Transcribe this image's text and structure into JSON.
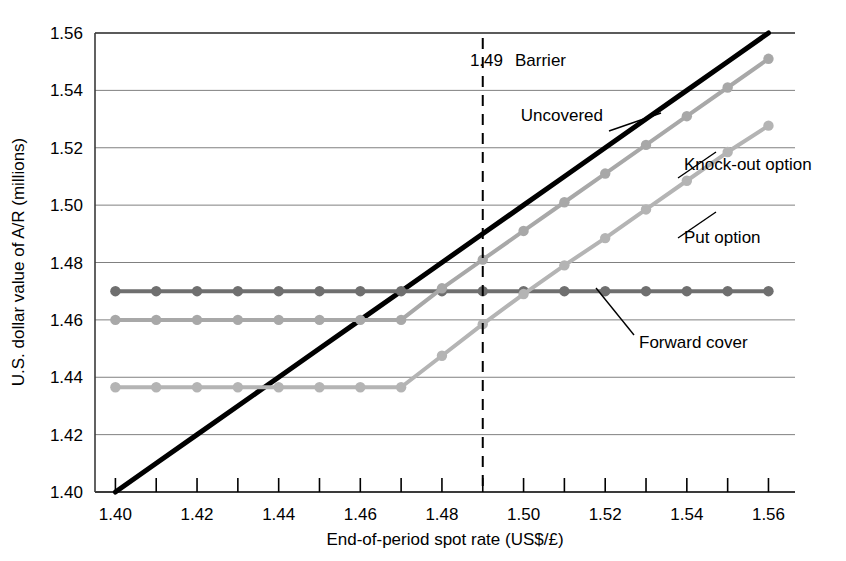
{
  "chart_data": {
    "type": "line",
    "title": "",
    "xlabel": "End-of-period spot rate (US$/£)",
    "ylabel": "U.S. dollar value of A/R (millions)",
    "xlim": [
      1.395,
      1.5665
    ],
    "ylim": [
      1.4,
      1.56
    ],
    "grid": true,
    "legend_position": "inline-annotations",
    "x_ticks": [
      "1.40",
      "1.42",
      "1.44",
      "1.46",
      "1.48",
      "1.50",
      "1.52",
      "1.54",
      "1.56"
    ],
    "x_tick_values": [
      1.4,
      1.42,
      1.44,
      1.46,
      1.48,
      1.5,
      1.52,
      1.54,
      1.56
    ],
    "x_minor_tick_values": [
      1.41,
      1.43,
      1.45,
      1.47,
      1.49,
      1.51,
      1.53,
      1.55
    ],
    "y_ticks": [
      "1.40",
      "1.42",
      "1.44",
      "1.46",
      "1.48",
      "1.50",
      "1.52",
      "1.54",
      "1.56"
    ],
    "y_tick_values": [
      1.4,
      1.42,
      1.44,
      1.46,
      1.48,
      1.5,
      1.52,
      1.54,
      1.56
    ],
    "x": [
      1.4,
      1.41,
      1.42,
      1.43,
      1.44,
      1.45,
      1.46,
      1.47,
      1.48,
      1.49,
      1.5,
      1.51,
      1.52,
      1.53,
      1.54,
      1.55,
      1.56
    ],
    "series": [
      {
        "name": "Uncovered",
        "color": "#000000",
        "width": 5,
        "markers": false,
        "values": [
          1.4,
          1.41,
          1.42,
          1.43,
          1.44,
          1.45,
          1.46,
          1.47,
          1.48,
          1.49,
          1.5,
          1.51,
          1.52,
          1.53,
          1.54,
          1.55,
          1.56
        ]
      },
      {
        "name": "Forward cover",
        "color": "#6f6f6f",
        "width": 4,
        "markers": true,
        "values": [
          1.47,
          1.47,
          1.47,
          1.47,
          1.47,
          1.47,
          1.47,
          1.47,
          1.47,
          1.47,
          1.47,
          1.47,
          1.47,
          1.47,
          1.47,
          1.47,
          1.47
        ]
      },
      {
        "name": "Knock-out option",
        "color": "#a8a8a8",
        "width": 4,
        "markers": true,
        "values": [
          1.46,
          1.46,
          1.46,
          1.46,
          1.46,
          1.46,
          1.46,
          1.46,
          1.471,
          1.481,
          1.491,
          1.501,
          1.511,
          1.521,
          1.531,
          1.541,
          1.551
        ]
      },
      {
        "name": "Put option",
        "color": "#b4b4b4",
        "width": 4,
        "markers": true,
        "values": [
          1.4365,
          1.4365,
          1.4365,
          1.4365,
          1.4365,
          1.4365,
          1.4365,
          1.4365,
          1.4475,
          1.4585,
          1.469,
          1.479,
          1.4885,
          1.4985,
          1.5085,
          1.5185,
          1.5277
        ]
      }
    ],
    "annotations": [
      {
        "name": "barrier",
        "label": "Barrier",
        "value_label": "1.49",
        "x": 1.49,
        "style": "vertical-dashed",
        "color": "#000000"
      },
      {
        "name": "uncovered-label",
        "label": "Uncovered"
      },
      {
        "name": "knock-out-label",
        "label": "Knock-out option"
      },
      {
        "name": "put-option-label",
        "label": "Put option"
      },
      {
        "name": "forward-cover-label",
        "label": "Forward cover"
      }
    ]
  },
  "axes": {
    "x_title": "End-of-period spot rate (US$/£)",
    "y_title": "U.S. dollar value of A/R (millions)"
  },
  "labels": {
    "barrier_value": "1.49",
    "barrier": "Barrier",
    "uncovered": "Uncovered",
    "knock_out": "Knock-out option",
    "put_option": "Put option",
    "forward_cover": "Forward cover"
  },
  "x_tick_labels": [
    "1.40",
    "1.42",
    "1.44",
    "1.46",
    "1.48",
    "1.50",
    "1.52",
    "1.54",
    "1.56"
  ],
  "y_tick_labels": [
    "1.56",
    "1.54",
    "1.52",
    "1.50",
    "1.48",
    "1.46",
    "1.44",
    "1.42",
    "1.40"
  ],
  "colors": {
    "uncovered": "#000000",
    "forward_cover": "#6f6f6f",
    "knock_out": "#a8a8a8",
    "put_option": "#b4b4b4",
    "grid": "#808080",
    "frame": "#404040"
  }
}
